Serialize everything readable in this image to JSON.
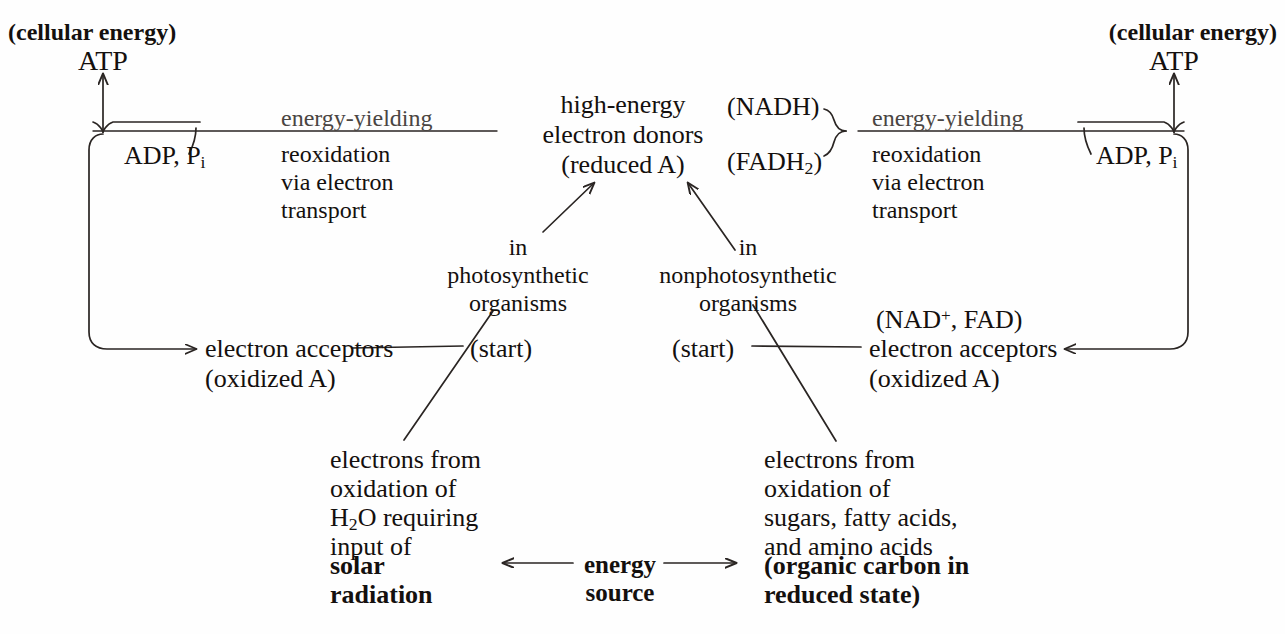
{
  "diagram": {
    "stroke_color": "#2a2523",
    "background": "#fefefe"
  },
  "left_cycle": {
    "cellular_energy_label": "(cellular energy)",
    "atp_label": "ATP",
    "adp_pi_label": "ADP, Pi",
    "adp_pi_main": "ADP, P",
    "adp_pi_sub": "i",
    "energy_yielding_label": "energy-yielding",
    "reoxidation_line1": "reoxidation",
    "reoxidation_line2": "via electron",
    "reoxidation_line3": "transport",
    "electron_acceptors_line1": "electron acceptors",
    "electron_acceptors_line2": "(oxidized A)",
    "start_label": "(start)"
  },
  "right_cycle": {
    "cellular_energy_label": "(cellular energy)",
    "atp_label": "ATP",
    "adp_pi_main": "ADP, P",
    "adp_pi_sub": "i",
    "energy_yielding_label": "energy-yielding",
    "reoxidation_line1": "reoxidation",
    "reoxidation_line2": "via electron",
    "reoxidation_line3": "transport",
    "cofactors_label": "(NAD+, FAD)",
    "cofactors_prefix": "(NAD",
    "cofactors_sup": "+",
    "cofactors_suffix": ", FAD)",
    "electron_acceptors_line1": "electron acceptors",
    "electron_acceptors_line2": "(oxidized A)",
    "start_label": "(start)"
  },
  "center": {
    "donors_line1": "high-energy",
    "donors_line2": "electron donors",
    "donors_line3": "(reduced A)",
    "nadh_label": "(NADH)",
    "fadh2_prefix": "(FADH",
    "fadh2_sub": "2",
    "fadh2_suffix": ")"
  },
  "photosynthetic_branch": {
    "line1": "in",
    "line2": "photosynthetic",
    "line3": "organisms"
  },
  "nonphotosynthetic_branch": {
    "line1": "in",
    "line2": "nonphotosynthetic",
    "line3": "organisms"
  },
  "left_source": {
    "line1": "electrons from",
    "line2": "oxidation of",
    "line3_prefix": "H",
    "line3_sub": "2",
    "line3_suffix": "O requiring",
    "line4": "input of",
    "bold_line1": "solar",
    "bold_line2": "radiation"
  },
  "right_source": {
    "line1": "electrons from",
    "line2": "oxidation of",
    "line3": "sugars, fatty acids,",
    "line4": "and amino acids",
    "bold_line1": "(organic carbon in",
    "bold_line2": "reduced state)"
  },
  "energy_source": {
    "line1": "energy",
    "line2": "source"
  }
}
